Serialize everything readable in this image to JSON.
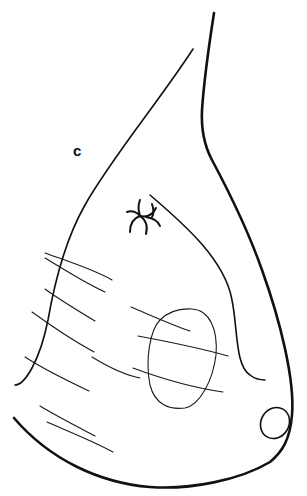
{
  "figure": {
    "panel_label": "c"
  },
  "colors": {
    "background": "#ffffff",
    "stroke": "#111111"
  }
}
